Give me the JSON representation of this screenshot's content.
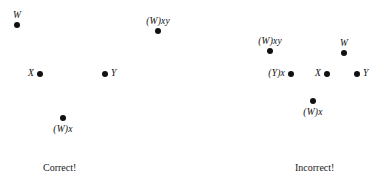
{
  "figure": {
    "background_color": "#ffffff",
    "dot_color": "#111111",
    "text_color": "#111111",
    "width": 387,
    "height": 187
  },
  "panels": [
    {
      "id": "correct",
      "caption": "Correct!",
      "caption_x": 43,
      "caption_y": 163,
      "nodes": [
        {
          "label": "W",
          "x": 17,
          "y": 25,
          "label_pos": "above"
        },
        {
          "label": "(W)xy",
          "x": 158,
          "y": 31,
          "label_pos": "above"
        },
        {
          "label": "X",
          "x": 40,
          "y": 74,
          "label_pos": "left"
        },
        {
          "label": "Y",
          "x": 105,
          "y": 74,
          "label_pos": "right"
        },
        {
          "label": "(W)x",
          "x": 63,
          "y": 118,
          "label_pos": "below"
        }
      ]
    },
    {
      "id": "incorrect",
      "caption": "Incorrect!",
      "caption_x": 100,
      "caption_y": 163,
      "nodes": [
        {
          "label": "(W)xy",
          "x": 75,
          "y": 51,
          "label_pos": "above"
        },
        {
          "label": "W",
          "x": 149,
          "y": 53,
          "label_pos": "above"
        },
        {
          "label": "(Y)x",
          "x": 96,
          "y": 74,
          "label_pos": "left"
        },
        {
          "label": "X",
          "x": 132,
          "y": 74,
          "label_pos": "left"
        },
        {
          "label": "Y",
          "x": 162,
          "y": 74,
          "label_pos": "right"
        },
        {
          "label": "(W)x",
          "x": 118,
          "y": 101,
          "label_pos": "below"
        }
      ]
    }
  ]
}
